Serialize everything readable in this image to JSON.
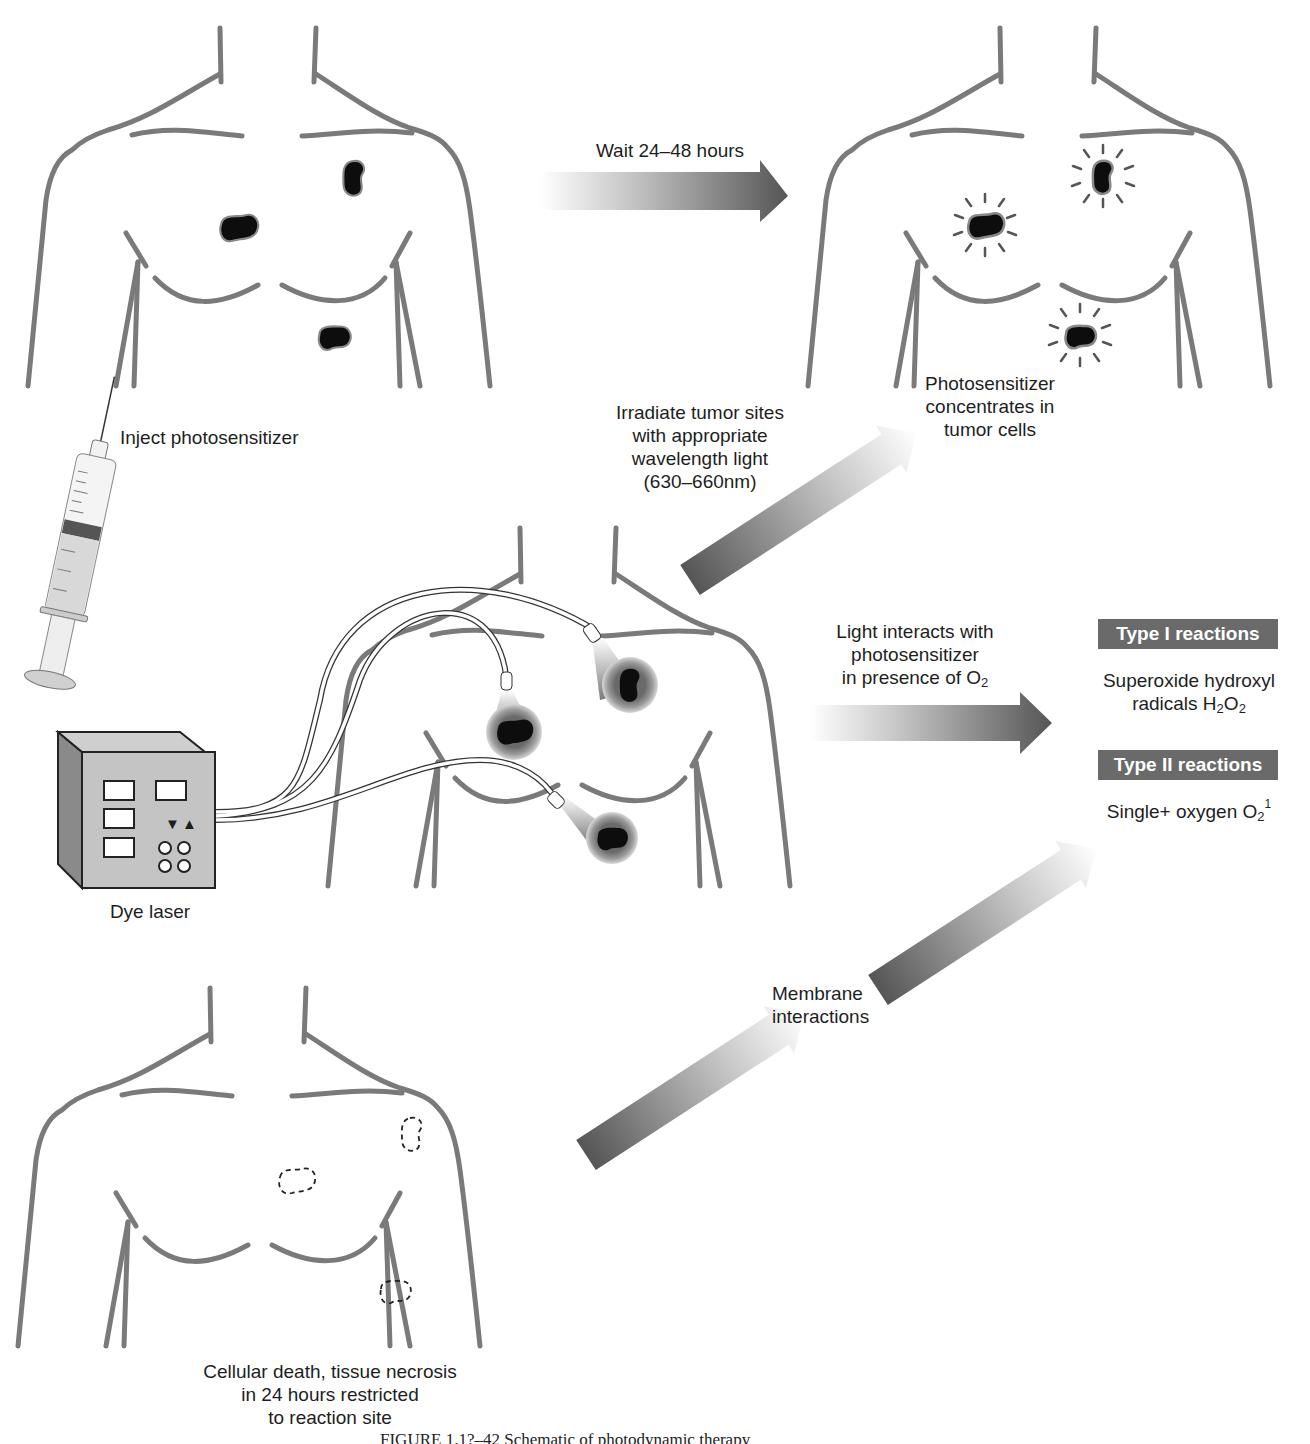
{
  "figure": {
    "caption": "FIGURE 1.1?–42 Schematic of photodynamic therapy"
  },
  "steps": {
    "inject": {
      "label": "Inject photosensitizer"
    },
    "wait": {
      "label": "Wait 24–48 hours"
    },
    "concentrates": {
      "line1": "Photosensitizer",
      "line2": "concentrates in",
      "line3": "tumor cells"
    },
    "irradiate": {
      "line1": "Irradiate tumor sites",
      "line2": "with appropriate",
      "line3": "wavelength light",
      "line4": "(630–660nm)"
    },
    "light_interacts": {
      "line1": "Light interacts with",
      "line2": "photosensitizer",
      "line3_prefix": "in presence of O",
      "line3_sub": "2"
    },
    "membrane": {
      "line1": "Membrane",
      "line2": "interactions"
    },
    "result": {
      "line1": "Cellular death, tissue necrosis",
      "line2": "in 24 hours restricted",
      "line3": "to reaction site"
    }
  },
  "reactions": {
    "type1": {
      "title": "Type I reactions",
      "line1": "Superoxide hydroxyl",
      "line2_prefix": "radicals H",
      "line2_sub1": "2",
      "line2_mid": "O",
      "line2_sub2": "2"
    },
    "type2": {
      "title": "Type II reactions",
      "line1_prefix": "Single+ oxygen O",
      "line1_sub": "2",
      "line1_sup": "1"
    }
  },
  "device": {
    "label": "Dye laser",
    "controls": [
      "▼",
      "▲"
    ]
  },
  "colors": {
    "outline": "#7a7a7a",
    "arrow_dark": "#5a5a5a",
    "badge_bg": "#6a6a6a",
    "tumor": "#0d0d0d"
  }
}
